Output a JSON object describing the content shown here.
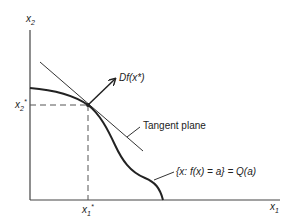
{
  "diagram": {
    "axes": {
      "x_label": "x",
      "x_sub": "1",
      "y_label": "x",
      "y_sub": "2"
    },
    "point": {
      "x_star_label": "x",
      "x_star_sub": "1",
      "x_star_sup": "*",
      "y_star_label": "x",
      "y_star_sub": "2",
      "y_star_sup": "*"
    },
    "gradient_label": "Df(x*)",
    "tangent_label": "Tangent plane",
    "level_set_label": "{x: f(x) = a} = Q(a)",
    "colors": {
      "ink": "#222222",
      "background": "#ffffff"
    }
  }
}
